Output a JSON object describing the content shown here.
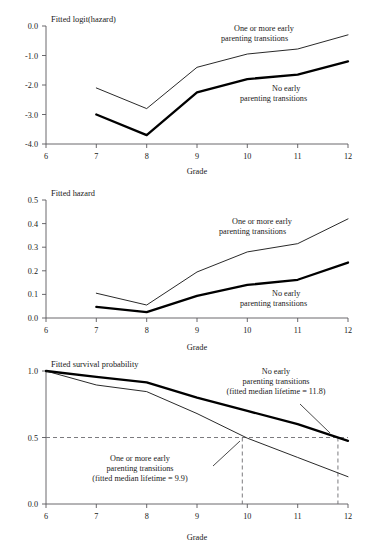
{
  "figure": {
    "x_axis_label": "Grade",
    "x_ticks": [
      "6",
      "7",
      "8",
      "9",
      "10",
      "11",
      "12"
    ],
    "series_names": {
      "thin": "One or more early parenting transitions",
      "thick": "No early parenting transitions"
    }
  },
  "panel1": {
    "title": "Fitted logit(hazard)",
    "y_ticks": [
      "0.0",
      "-1.0",
      "-2.0",
      "-3.0",
      "-4.0"
    ],
    "annotation_thin_line1": "One or more early",
    "annotation_thin_line2": "parenting transitions",
    "annotation_thick_line1": "No early",
    "annotation_thick_line2": "parenting transitions",
    "x_axis_label": "Grade"
  },
  "panel2": {
    "title": "Fitted hazard",
    "y_ticks": [
      "0.5",
      "0.4",
      "0.3",
      "0.2",
      "0.1",
      "0.0"
    ],
    "annotation_thin_line1": "One or more early",
    "annotation_thin_line2": "parenting transitions",
    "annotation_thick_line1": "No early",
    "annotation_thick_line2": "parenting transitions",
    "x_axis_label": "Grade"
  },
  "panel3": {
    "title": "Fitted survival probability",
    "y_ticks": [
      "1.0",
      "0.5",
      "0.0"
    ],
    "annotation_thick_line1": "No early",
    "annotation_thick_line2": "parenting transitions",
    "annotation_thick_line3": "(fitted median lifetime = 11.8)",
    "annotation_thin_line1": "One or more early",
    "annotation_thin_line2": "parenting transitions",
    "annotation_thin_line3": "(fitted median lifetime = 9.9)",
    "x_axis_label": "Grade"
  },
  "chart_data": [
    {
      "type": "line",
      "title": "Fitted logit(hazard)",
      "xlabel": "Grade",
      "ylabel": "Fitted logit(hazard)",
      "x": [
        7,
        8,
        9,
        10,
        11,
        12
      ],
      "xlim": [
        6,
        12
      ],
      "ylim": [
        -4.0,
        0.0
      ],
      "xticks": [
        6,
        7,
        8,
        9,
        10,
        11,
        12
      ],
      "yticks": [
        0.0,
        -1.0,
        -2.0,
        -3.0,
        -4.0
      ],
      "grid": false,
      "legend": "inline annotations",
      "series": [
        {
          "name": "One or more early parenting transitions",
          "style": "thin",
          "values": [
            -2.1,
            -2.8,
            -1.4,
            -0.95,
            -0.78,
            -0.3
          ]
        },
        {
          "name": "No early parenting transitions",
          "style": "thick",
          "values": [
            -3.0,
            -3.7,
            -2.25,
            -1.8,
            -1.65,
            -1.2
          ]
        }
      ]
    },
    {
      "type": "line",
      "title": "Fitted hazard",
      "xlabel": "Grade",
      "ylabel": "Fitted hazard",
      "x": [
        7,
        8,
        9,
        10,
        11,
        12
      ],
      "xlim": [
        6,
        12
      ],
      "ylim": [
        0.0,
        0.5
      ],
      "xticks": [
        6,
        7,
        8,
        9,
        10,
        11,
        12
      ],
      "yticks": [
        0.0,
        0.1,
        0.2,
        0.3,
        0.4,
        0.5
      ],
      "grid": false,
      "legend": "inline annotations",
      "series": [
        {
          "name": "One or more early parenting transitions",
          "style": "thin",
          "values": [
            0.105,
            0.055,
            0.195,
            0.28,
            0.315,
            0.42
          ]
        },
        {
          "name": "No early parenting transitions",
          "style": "thick",
          "values": [
            0.047,
            0.025,
            0.094,
            0.14,
            0.162,
            0.235
          ]
        }
      ]
    },
    {
      "type": "line",
      "title": "Fitted survival probability",
      "xlabel": "Grade",
      "ylabel": "Fitted survival probability",
      "x": [
        6,
        7,
        8,
        9,
        10,
        11,
        12
      ],
      "xlim": [
        6,
        12
      ],
      "ylim": [
        0.0,
        1.0
      ],
      "xticks": [
        6,
        7,
        8,
        9,
        10,
        11,
        12
      ],
      "yticks": [
        0.0,
        0.5,
        1.0
      ],
      "grid": false,
      "legend": "inline annotations",
      "reference_lines": [
        {
          "orientation": "horizontal",
          "value": 0.5,
          "style": "dashed"
        },
        {
          "orientation": "vertical",
          "value": 9.9,
          "style": "dashed"
        },
        {
          "orientation": "vertical",
          "value": 11.8,
          "style": "dashed"
        }
      ],
      "series": [
        {
          "name": "No early parenting transitions",
          "style": "thick",
          "median_lifetime": 11.8,
          "values": [
            1.0,
            0.955,
            0.915,
            0.8,
            0.7,
            0.6,
            0.475
          ]
        },
        {
          "name": "One or more early parenting transitions",
          "style": "thin",
          "median_lifetime": 9.9,
          "values": [
            1.0,
            0.895,
            0.845,
            0.68,
            0.495,
            0.35,
            0.205
          ]
        }
      ]
    }
  ]
}
